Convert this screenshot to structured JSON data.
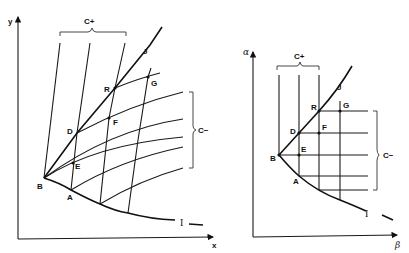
{
  "left_diagram": {
    "axes": {
      "x_label": "x",
      "y_label": "y"
    },
    "points": {
      "A": "A",
      "B": "B",
      "D": "D",
      "E": "E",
      "F": "F",
      "G": "G",
      "R": "R"
    },
    "curves": {
      "J": "J",
      "I": "I"
    },
    "families": {
      "c_plus": "C+",
      "c_minus": "C−"
    }
  },
  "right_diagram": {
    "axes": {
      "x_label": "β",
      "y_label": "α"
    },
    "points": {
      "A": "A",
      "B": "B",
      "D": "D",
      "E": "E",
      "F": "F",
      "G": "G",
      "R": "R"
    },
    "curves": {
      "J": "J",
      "I": "I"
    },
    "families": {
      "c_plus": "C+",
      "c_minus": "C−"
    }
  }
}
